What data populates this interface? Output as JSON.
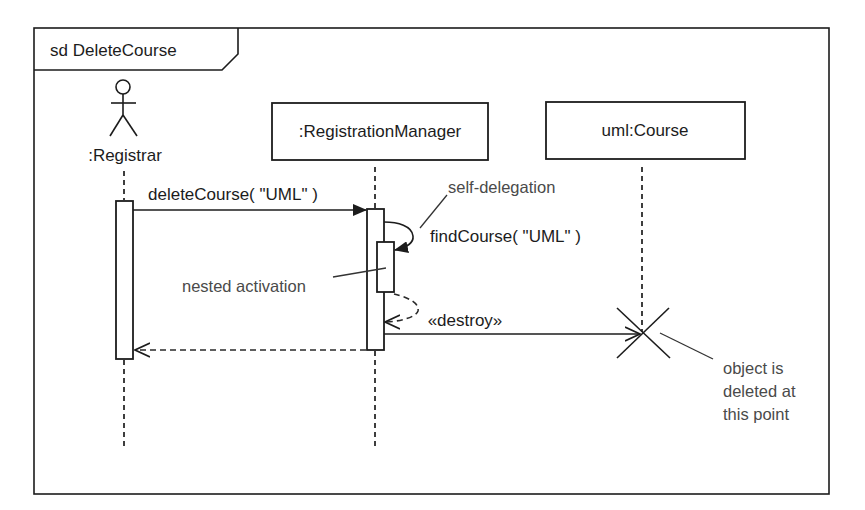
{
  "diagram": {
    "type": "UML sequence diagram",
    "frame": {
      "label": "sd DeleteCourse"
    },
    "lifelines": [
      {
        "id": "registrar",
        "label": ":Registrar",
        "kind": "actor"
      },
      {
        "id": "registration_manager",
        "label": ":RegistrationManager",
        "kind": "object"
      },
      {
        "id": "course",
        "label": "uml:Course",
        "kind": "object"
      }
    ],
    "messages": [
      {
        "from": "registrar",
        "to": "registration_manager",
        "label": "deleteCourse( \"UML\" )",
        "kind": "synchronous"
      },
      {
        "from": "registration_manager",
        "to": "registration_manager",
        "label": "findCourse( \"UML\" )",
        "kind": "self-call"
      },
      {
        "from": "registration_manager",
        "to": "registration_manager",
        "label": "",
        "kind": "self-return"
      },
      {
        "from": "registration_manager",
        "to": "course",
        "label": "«destroy»",
        "kind": "destroy"
      },
      {
        "from": "registration_manager",
        "to": "registrar",
        "label": "",
        "kind": "return"
      }
    ],
    "annotations": {
      "self_delegation": "self-delegation",
      "nested_activation": "nested activation",
      "deleted_line1": "object is",
      "deleted_line2": "deleted at",
      "deleted_line3": "this point"
    },
    "colors": {
      "ink": "#1c1c1c",
      "note_ink": "#4a4a4a",
      "background": "#ffffff"
    }
  }
}
